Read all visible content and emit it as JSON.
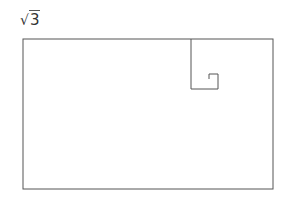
{
  "title": {
    "radical": "√",
    "radicand": "3"
  },
  "diagram": {
    "stroke_color": "#555555"
  }
}
